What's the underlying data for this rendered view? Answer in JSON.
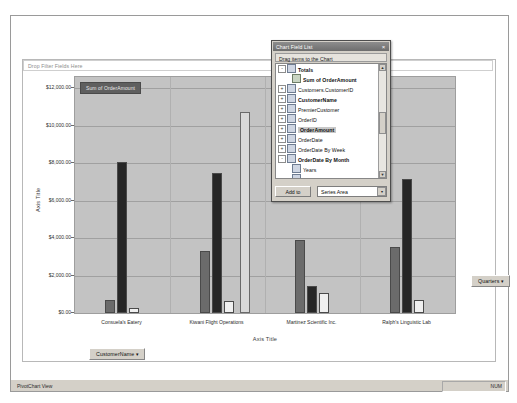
{
  "window": {
    "status_bar_left": "PivotChart View",
    "status_bar_right": "NUM"
  },
  "chart_area": {
    "filter_drop_text": "Drop Filter Fields Here",
    "series_field_label": "Sum of OrderAmount",
    "customer_field_button": "CustomerName",
    "quarters_field_button": "Quarters",
    "dropdown_arrow": "▾"
  },
  "field_list": {
    "title": "Chart Field List",
    "close_label": "×",
    "subtitle": "Drag items to the Chart",
    "add_to_button": "Add to",
    "area_select_value": "Series Area",
    "area_select_arrow": "▾",
    "scroll_up": "▲",
    "scroll_down": "▼",
    "items": [
      {
        "label": "Totals",
        "indent": 0,
        "bold": true,
        "expander": "-",
        "icon": "totals-icon",
        "selected": false
      },
      {
        "label": "Sum of OrderAmount",
        "indent": 1,
        "bold": true,
        "expander": "",
        "icon": "sum-icon",
        "selected": false
      },
      {
        "label": "Customers.CustomerID",
        "indent": 0,
        "bold": false,
        "expander": "+",
        "icon": "field-icon",
        "selected": false
      },
      {
        "label": "CustomerName",
        "indent": 0,
        "bold": true,
        "expander": "+",
        "icon": "field-icon",
        "selected": false
      },
      {
        "label": "PremierCustomer",
        "indent": 0,
        "bold": false,
        "expander": "+",
        "icon": "field-icon",
        "selected": false
      },
      {
        "label": "OrderID",
        "indent": 0,
        "bold": false,
        "expander": "+",
        "icon": "field-icon",
        "selected": false
      },
      {
        "label": "OrderAmount",
        "indent": 0,
        "bold": true,
        "expander": "+",
        "icon": "field-icon",
        "selected": true
      },
      {
        "label": "OrderDate",
        "indent": 0,
        "bold": false,
        "expander": "+",
        "icon": "field-icon",
        "selected": false
      },
      {
        "label": "OrderDate By Week",
        "indent": 0,
        "bold": false,
        "expander": "+",
        "icon": "field-icon",
        "selected": false
      },
      {
        "label": "OrderDate By Month",
        "indent": 0,
        "bold": true,
        "expander": "-",
        "icon": "field-icon",
        "selected": false
      },
      {
        "label": "Years",
        "indent": 1,
        "bold": false,
        "expander": "",
        "icon": "field-icon",
        "selected": false
      },
      {
        "label": "Quarters",
        "indent": 1,
        "bold": true,
        "expander": "",
        "icon": "field-icon",
        "selected": false
      },
      {
        "label": "Months",
        "indent": 1,
        "bold": false,
        "expander": "",
        "icon": "field-icon",
        "selected": false
      },
      {
        "label": "Days",
        "indent": 1,
        "bold": false,
        "expander": "",
        "icon": "field-icon",
        "selected": false
      },
      {
        "label": "Hours",
        "indent": 1,
        "bold": false,
        "expander": "",
        "icon": "field-icon",
        "selected": false
      },
      {
        "label": "Minutes",
        "indent": 1,
        "bold": false,
        "expander": "",
        "icon": "field-icon",
        "selected": false
      }
    ]
  },
  "chart_data": {
    "type": "bar",
    "title": "",
    "xlabel": "Axis Title",
    "ylabel": "Axis Title",
    "categories": [
      "Consuela's Eatery",
      "Kiwani Flight Operations",
      "Martinez Scientific Inc.",
      "Ralph's Linguistic Lab"
    ],
    "series": [
      {
        "name": "Qtr1",
        "color": "#6b6b6b",
        "values": [
          700,
          3300,
          3900,
          3550
        ]
      },
      {
        "name": "Qtr2",
        "color": "#262626",
        "values": [
          8050,
          7450,
          1450,
          7150
        ]
      },
      {
        "name": "Qtr3",
        "color": "#f0f0f0",
        "values": [
          250,
          650,
          1050,
          700
        ]
      }
    ],
    "extra_series": [
      {
        "name": "Qtr-tall",
        "color": "#d9d9d9",
        "category_index": 1,
        "value": 10750
      }
    ],
    "ylim": [
      0,
      12600
    ],
    "ytick_values": [
      0,
      2000,
      4000,
      6000,
      8000,
      10000,
      12000
    ],
    "ytick_labels": [
      "$0.00",
      "$2,000.00",
      "$4,000.00",
      "$6,000.00",
      "$8,000.00",
      "$10,000.00",
      "$12,000.00"
    ],
    "grid": true,
    "legend_position": "none",
    "plot_background": "#c3c3c3"
  }
}
